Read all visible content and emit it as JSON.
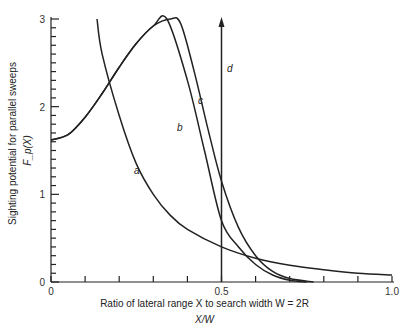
{
  "chart_data": {
    "type": "line",
    "title": "",
    "xlabel": "Ratio of lateral range X to search width W = 2R",
    "xlabel_sub": "X/W",
    "ylabel": "Sighting potential for parallel sweeps",
    "ylabel_sub": "F_p(X)",
    "xlim": [
      0,
      1.0
    ],
    "ylim": [
      0,
      3
    ],
    "x_ticks": [
      "0",
      "0.5",
      "1.0"
    ],
    "y_ticks": [
      "0",
      "1",
      "2",
      "3"
    ],
    "grid": false,
    "series": [
      {
        "name": "a",
        "x": [
          0.135,
          0.15,
          0.2,
          0.25,
          0.3,
          0.35,
          0.4,
          0.5,
          0.6,
          0.7,
          0.8,
          0.9,
          1.0
        ],
        "values": [
          3.0,
          2.6,
          1.9,
          1.35,
          1.0,
          0.76,
          0.6,
          0.4,
          0.27,
          0.19,
          0.14,
          0.1,
          0.08
        ]
      },
      {
        "name": "b",
        "x": [
          0,
          0.05,
          0.1,
          0.15,
          0.2,
          0.25,
          0.3,
          0.34,
          0.4,
          0.45,
          0.5,
          0.55,
          0.6,
          0.65,
          0.7,
          0.75
        ],
        "values": [
          1.62,
          1.68,
          1.88,
          2.15,
          2.45,
          2.72,
          2.92,
          3.0,
          2.3,
          1.5,
          0.7,
          0.4,
          0.2,
          0.08,
          0.02,
          0.0
        ]
      },
      {
        "name": "c",
        "x": [
          0,
          0.05,
          0.1,
          0.15,
          0.2,
          0.25,
          0.3,
          0.35,
          0.38,
          0.42,
          0.46,
          0.5,
          0.55,
          0.6,
          0.65,
          0.7,
          0.77
        ],
        "values": [
          1.62,
          1.68,
          1.88,
          2.15,
          2.45,
          2.72,
          2.92,
          3.0,
          2.95,
          2.4,
          1.75,
          1.15,
          0.62,
          0.3,
          0.12,
          0.04,
          0.0
        ]
      },
      {
        "name": "d",
        "x": [
          0.5,
          0.5
        ],
        "values": [
          0,
          3.0
        ],
        "style": "vertical arrow"
      }
    ],
    "annotations": [
      "a",
      "b",
      "c",
      "d"
    ]
  }
}
